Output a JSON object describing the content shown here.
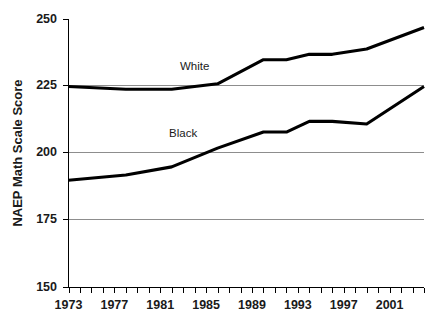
{
  "chart_data": {
    "type": "line",
    "title": "",
    "subtitle": "",
    "xlabel": "",
    "ylabel": "NAEP Math Scale Score",
    "ylim": [
      150,
      250
    ],
    "xlim": [
      1973,
      2004
    ],
    "grid": true,
    "gridlines_y": [
      175,
      200,
      225
    ],
    "legend_position": "inline-annotation",
    "y_ticks": [
      150,
      175,
      200,
      225,
      250
    ],
    "y_tick_labels": [
      "150",
      "175",
      "200",
      "225",
      "250"
    ],
    "x_ticks": [
      1973,
      1974,
      1975,
      1976,
      1977,
      1978,
      1979,
      1980,
      1981,
      1982,
      1983,
      1984,
      1985,
      1986,
      1987,
      1988,
      1989,
      1990,
      1991,
      1992,
      1993,
      1994,
      1995,
      1996,
      1997,
      1998,
      1999,
      2000,
      2001,
      2002,
      2003,
      2004
    ],
    "x_tick_labels_shown": [
      "1973",
      "1977",
      "1981",
      "1985",
      "1989",
      "1993",
      "1997",
      "2001"
    ],
    "x_labeled_years": [
      1973,
      1977,
      1981,
      1985,
      1989,
      1993,
      1997,
      2001
    ],
    "series": [
      {
        "name": "White",
        "color": "#000000",
        "x": [
          1973,
          1978,
          1982,
          1986,
          1990,
          1992,
          1994,
          1996,
          1999,
          2004
        ],
        "values": [
          225,
          224,
          224,
          226,
          235,
          235,
          237,
          237,
          239,
          247
        ]
      },
      {
        "name": "Black",
        "color": "#000000",
        "x": [
          1973,
          1978,
          1982,
          1986,
          1990,
          1992,
          1994,
          1996,
          1999,
          2004
        ],
        "values": [
          190,
          192,
          195,
          202,
          208,
          208,
          212,
          212,
          211,
          225
        ]
      }
    ],
    "annotations": [
      {
        "text": "White",
        "x": 1984,
        "y": 231
      },
      {
        "text": "Black",
        "x": 1983,
        "y": 206
      }
    ]
  },
  "colors": {
    "background": "#ffffff",
    "axis": "#000000",
    "gridline": "#8d8d8d",
    "line": "#000000",
    "text": "#1a1a1a"
  }
}
